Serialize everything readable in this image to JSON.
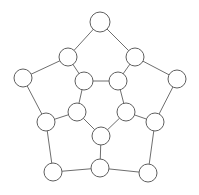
{
  "figure": {
    "background_color": "#ffffff",
    "canvas": {
      "width": 199,
      "height": 195
    }
  },
  "style": {
    "edge_color": "#6e6e6e",
    "edge_width": 1,
    "node_fill": "#ffffff",
    "node_stroke": "#5f5f5f",
    "node_stroke_width": 1
  },
  "chart_data": {
    "type": "graph",
    "node_count": 20,
    "edge_count": 30,
    "node_radius": [
      10,
      10,
      9,
      9,
      9,
      9,
      9,
      9,
      9,
      9,
      9,
      9,
      9,
      9,
      9,
      9,
      9,
      9,
      9,
      9
    ],
    "nodes": [
      {
        "id": "o-top",
        "label": "",
        "ring": "outer",
        "x": 100,
        "y": 22,
        "r": 10
      },
      {
        "id": "o-left",
        "label": "",
        "ring": "outer",
        "x": 23,
        "y": 78,
        "r": 9
      },
      {
        "id": "o-right",
        "label": "",
        "ring": "outer",
        "x": 177,
        "y": 79,
        "r": 9
      },
      {
        "id": "o-botleft",
        "label": "",
        "ring": "outer",
        "x": 53,
        "y": 172,
        "r": 9
      },
      {
        "id": "o-botright",
        "label": "",
        "ring": "outer",
        "x": 148,
        "y": 173,
        "r": 9
      },
      {
        "id": "m-upleft",
        "label": "",
        "ring": "second",
        "x": 68,
        "y": 57,
        "r": 9
      },
      {
        "id": "m-upright",
        "label": "",
        "ring": "second",
        "x": 135,
        "y": 57,
        "r": 9
      },
      {
        "id": "m-left",
        "label": "",
        "ring": "second",
        "x": 46,
        "y": 122,
        "r": 9
      },
      {
        "id": "m-right",
        "label": "",
        "ring": "second",
        "x": 155,
        "y": 122,
        "r": 9
      },
      {
        "id": "m-bottom",
        "label": "",
        "ring": "second",
        "x": 100,
        "y": 168,
        "r": 9
      },
      {
        "id": "t-upleft",
        "label": "",
        "ring": "third",
        "x": 84,
        "y": 81,
        "r": 9
      },
      {
        "id": "t-upright",
        "label": "",
        "ring": "third",
        "x": 118,
        "y": 81,
        "r": 9
      },
      {
        "id": "t-left",
        "label": "",
        "ring": "third",
        "x": 77,
        "y": 112,
        "r": 9
      },
      {
        "id": "t-right",
        "label": "",
        "ring": "third",
        "x": 126,
        "y": 112,
        "r": 9
      },
      {
        "id": "t-bottom",
        "label": "",
        "ring": "third",
        "x": 101,
        "y": 136,
        "r": 9
      }
    ],
    "edges": [
      {
        "from": "o-top",
        "to": "m-upleft"
      },
      {
        "from": "o-top",
        "to": "m-upright"
      },
      {
        "from": "m-upleft",
        "to": "o-left"
      },
      {
        "from": "m-upright",
        "to": "o-right"
      },
      {
        "from": "o-left",
        "to": "m-left"
      },
      {
        "from": "o-right",
        "to": "m-right"
      },
      {
        "from": "m-left",
        "to": "o-botleft"
      },
      {
        "from": "m-right",
        "to": "o-botright"
      },
      {
        "from": "o-botleft",
        "to": "m-bottom"
      },
      {
        "from": "o-botright",
        "to": "m-bottom"
      },
      {
        "from": "m-upleft",
        "to": "t-upleft"
      },
      {
        "from": "m-upright",
        "to": "t-upright"
      },
      {
        "from": "m-left",
        "to": "t-left"
      },
      {
        "from": "m-right",
        "to": "t-right"
      },
      {
        "from": "m-bottom",
        "to": "t-bottom"
      },
      {
        "from": "t-upleft",
        "to": "t-upright"
      },
      {
        "from": "t-upleft",
        "to": "t-left"
      },
      {
        "from": "t-upright",
        "to": "t-right"
      },
      {
        "from": "t-left",
        "to": "t-bottom"
      },
      {
        "from": "t-right",
        "to": "t-bottom"
      }
    ]
  }
}
